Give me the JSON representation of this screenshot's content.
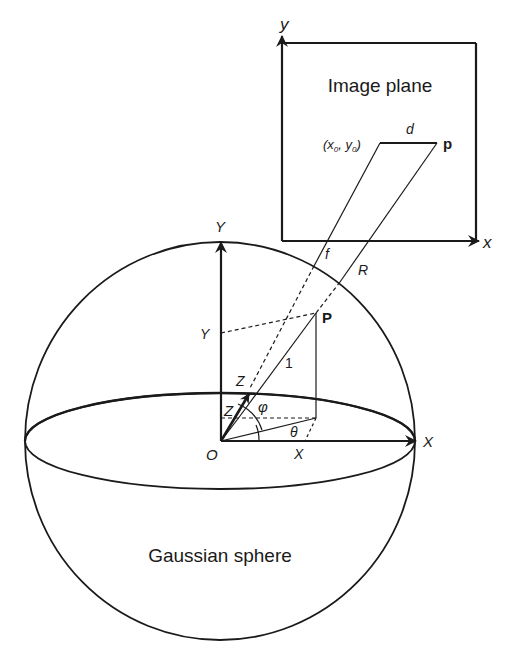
{
  "figure": {
    "image_plane": {
      "title": "Image plane",
      "axis_x": "x",
      "axis_y": "y",
      "principal_point": "(x",
      "principal_sub0": "0",
      "principal_mid": ", y",
      "principal_sub1": "0",
      "principal_close": ")",
      "distance_label": "d",
      "point_label": "p"
    },
    "rays": {
      "focal_label": "f",
      "range_label": "R"
    },
    "sphere": {
      "title": "Gaussian sphere",
      "origin_label": "O",
      "axis_X": "X",
      "axis_Y": "Y",
      "axis_Z": "Z",
      "point_label": "P",
      "unit_label": "1",
      "coord_X": "X",
      "coord_Y": "Y",
      "coord_Z": "Z",
      "angle_phi": "φ",
      "angle_theta": "θ"
    },
    "colors": {
      "stroke": "#1a1a1a",
      "background": "#ffffff"
    }
  }
}
